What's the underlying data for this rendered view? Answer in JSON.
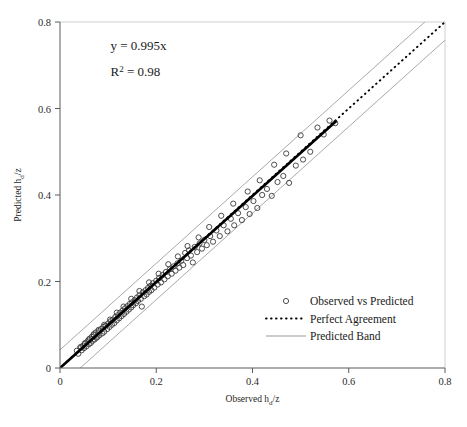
{
  "chart_data": {
    "type": "scatter",
    "title": "",
    "xlabel": "Observed hd/z",
    "ylabel": "Predicted hd/z",
    "xlabel_base": "Observed h",
    "xlabel_sub": "d",
    "xlabel_tail": "/z",
    "ylabel_base": "Predicted h",
    "ylabel_sub": "d",
    "ylabel_tail": "/z",
    "xlim": [
      0,
      0.8
    ],
    "ylim": [
      0,
      0.8
    ],
    "xticks": [
      0,
      0.2,
      0.4,
      0.6,
      0.8
    ],
    "yticks": [
      0,
      0.2,
      0.4,
      0.6,
      0.8
    ],
    "xticklabels": [
      "0",
      "0.2",
      "0.4",
      "0.6",
      "0.8"
    ],
    "yticklabels": [
      "0",
      "0.2",
      "0.4",
      "0.6",
      "0.8"
    ],
    "grid": false,
    "legend_position": "lower-right",
    "annotations": [
      {
        "text": "y = 0.995x",
        "x": 0.105,
        "y": 0.735
      },
      {
        "text": "R2 = 0.98",
        "base": "R",
        "sup": "2",
        "tail": " = 0.98",
        "x": 0.105,
        "y": 0.675
      }
    ],
    "fit": {
      "slope": 0.995,
      "intercept": 0,
      "r_squared": 0.98
    },
    "series": [
      {
        "name": "Observed vs Predicted",
        "type": "scatter",
        "marker": "open-circle",
        "points": [
          [
            0.035,
            0.04
          ],
          [
            0.038,
            0.033
          ],
          [
            0.042,
            0.048
          ],
          [
            0.045,
            0.041
          ],
          [
            0.048,
            0.052
          ],
          [
            0.05,
            0.046
          ],
          [
            0.052,
            0.057
          ],
          [
            0.055,
            0.05
          ],
          [
            0.057,
            0.062
          ],
          [
            0.06,
            0.055
          ],
          [
            0.062,
            0.068
          ],
          [
            0.064,
            0.058
          ],
          [
            0.066,
            0.072
          ],
          [
            0.068,
            0.063
          ],
          [
            0.07,
            0.078
          ],
          [
            0.072,
            0.066
          ],
          [
            0.074,
            0.082
          ],
          [
            0.076,
            0.07
          ],
          [
            0.078,
            0.072
          ],
          [
            0.08,
            0.085
          ],
          [
            0.082,
            0.076
          ],
          [
            0.085,
            0.09
          ],
          [
            0.088,
            0.08
          ],
          [
            0.09,
            0.095
          ],
          [
            0.092,
            0.084
          ],
          [
            0.095,
            0.098
          ],
          [
            0.098,
            0.09
          ],
          [
            0.1,
            0.103
          ],
          [
            0.103,
            0.095
          ],
          [
            0.105,
            0.108
          ],
          [
            0.108,
            0.1
          ],
          [
            0.11,
            0.112
          ],
          [
            0.113,
            0.104
          ],
          [
            0.115,
            0.118
          ],
          [
            0.118,
            0.11
          ],
          [
            0.12,
            0.122
          ],
          [
            0.123,
            0.115
          ],
          [
            0.125,
            0.128
          ],
          [
            0.128,
            0.12
          ],
          [
            0.13,
            0.133
          ],
          [
            0.133,
            0.125
          ],
          [
            0.135,
            0.138
          ],
          [
            0.138,
            0.13
          ],
          [
            0.14,
            0.143
          ],
          [
            0.143,
            0.135
          ],
          [
            0.145,
            0.148
          ],
          [
            0.148,
            0.14
          ],
          [
            0.15,
            0.152
          ],
          [
            0.152,
            0.145
          ],
          [
            0.155,
            0.157
          ],
          [
            0.158,
            0.15
          ],
          [
            0.16,
            0.163
          ],
          [
            0.162,
            0.155
          ],
          [
            0.165,
            0.168
          ],
          [
            0.168,
            0.16
          ],
          [
            0.17,
            0.142
          ],
          [
            0.172,
            0.175
          ],
          [
            0.175,
            0.166
          ],
          [
            0.178,
            0.18
          ],
          [
            0.18,
            0.17
          ],
          [
            0.183,
            0.185
          ],
          [
            0.185,
            0.176
          ],
          [
            0.188,
            0.19
          ],
          [
            0.19,
            0.18
          ],
          [
            0.193,
            0.196
          ],
          [
            0.196,
            0.186
          ],
          [
            0.2,
            0.202
          ],
          [
            0.203,
            0.193
          ],
          [
            0.206,
            0.208
          ],
          [
            0.21,
            0.198
          ],
          [
            0.213,
            0.215
          ],
          [
            0.217,
            0.205
          ],
          [
            0.22,
            0.222
          ],
          [
            0.224,
            0.212
          ],
          [
            0.228,
            0.228
          ],
          [
            0.232,
            0.218
          ],
          [
            0.236,
            0.235
          ],
          [
            0.24,
            0.225
          ],
          [
            0.244,
            0.242
          ],
          [
            0.248,
            0.232
          ],
          [
            0.252,
            0.248
          ],
          [
            0.256,
            0.238
          ],
          [
            0.26,
            0.266
          ],
          [
            0.264,
            0.254
          ],
          [
            0.268,
            0.272
          ],
          [
            0.272,
            0.26
          ],
          [
            0.276,
            0.244
          ],
          [
            0.28,
            0.28
          ],
          [
            0.285,
            0.268
          ],
          [
            0.29,
            0.288
          ],
          [
            0.295,
            0.276
          ],
          [
            0.3,
            0.296
          ],
          [
            0.305,
            0.284
          ],
          [
            0.312,
            0.305
          ],
          [
            0.318,
            0.292
          ],
          [
            0.325,
            0.318
          ],
          [
            0.332,
            0.305
          ],
          [
            0.34,
            0.33
          ],
          [
            0.348,
            0.316
          ],
          [
            0.355,
            0.345
          ],
          [
            0.362,
            0.33
          ],
          [
            0.37,
            0.358
          ],
          [
            0.378,
            0.342
          ],
          [
            0.386,
            0.372
          ],
          [
            0.394,
            0.356
          ],
          [
            0.402,
            0.386
          ],
          [
            0.41,
            0.37
          ],
          [
            0.42,
            0.4
          ],
          [
            0.43,
            0.414
          ],
          [
            0.44,
            0.398
          ],
          [
            0.452,
            0.43
          ],
          [
            0.464,
            0.444
          ],
          [
            0.476,
            0.428
          ],
          [
            0.49,
            0.468
          ],
          [
            0.505,
            0.482
          ],
          [
            0.52,
            0.5
          ],
          [
            0.535,
            0.556
          ],
          [
            0.548,
            0.54
          ],
          [
            0.56,
            0.572
          ],
          [
            0.572,
            0.566
          ],
          [
            0.5,
            0.538
          ],
          [
            0.47,
            0.496
          ],
          [
            0.445,
            0.47
          ],
          [
            0.415,
            0.434
          ],
          [
            0.39,
            0.408
          ],
          [
            0.36,
            0.38
          ],
          [
            0.335,
            0.352
          ],
          [
            0.31,
            0.326
          ],
          [
            0.288,
            0.302
          ],
          [
            0.265,
            0.282
          ],
          [
            0.245,
            0.258
          ],
          [
            0.225,
            0.24
          ],
          [
            0.205,
            0.218
          ],
          [
            0.185,
            0.198
          ],
          [
            0.165,
            0.178
          ],
          [
            0.148,
            0.16
          ],
          [
            0.132,
            0.142
          ],
          [
            0.118,
            0.128
          ],
          [
            0.104,
            0.112
          ],
          [
            0.092,
            0.1
          ],
          [
            0.08,
            0.088
          ],
          [
            0.07,
            0.076
          ],
          [
            0.06,
            0.066
          ],
          [
            0.052,
            0.057
          ],
          [
            0.044,
            0.048
          ]
        ]
      },
      {
        "name": "Perfect Agreement",
        "type": "line",
        "style": "dotted",
        "x": [
          0,
          0.8
        ],
        "y": [
          0,
          0.8
        ]
      },
      {
        "name": "Predicted Band",
        "type": "line",
        "style": "solid-thin",
        "upper": {
          "x": [
            0,
            0.8
          ],
          "y": [
            0.042,
            0.842
          ]
        },
        "lower": {
          "x": [
            0,
            0.8
          ],
          "y": [
            -0.042,
            0.758
          ]
        }
      },
      {
        "name": "Regression",
        "type": "line",
        "style": "thick-solid",
        "x": [
          0,
          0.573
        ],
        "y": [
          0,
          0.57
        ]
      }
    ]
  },
  "legend": {
    "items": [
      {
        "label": "Observed vs Predicted",
        "marker": "open-circle"
      },
      {
        "label": "Perfect Agreement",
        "marker": "dotted-line"
      },
      {
        "label": "Predicted Band",
        "marker": "solid-line"
      }
    ]
  }
}
